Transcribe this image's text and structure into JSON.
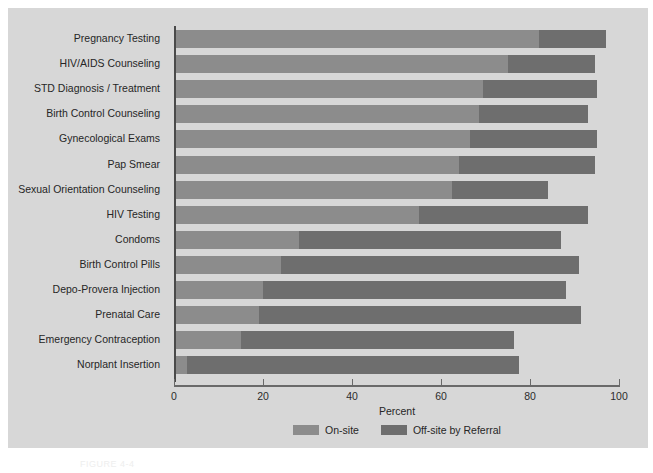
{
  "chart_data": {
    "type": "bar",
    "orientation": "horizontal",
    "stacked": true,
    "title": "",
    "xlabel": "Percent",
    "ylabel": "",
    "xlim": [
      0,
      100
    ],
    "xticks": [
      0,
      20,
      40,
      60,
      80,
      100
    ],
    "grid": false,
    "legend_position": "bottom-center",
    "categories": [
      "Pregnancy Testing",
      "HIV/AIDS Counseling",
      "STD Diagnosis / Treatment",
      "Birth Control Counseling",
      "Gynecological Exams",
      "Pap Smear",
      "Sexual Orientation Counseling",
      "HIV Testing",
      "Condoms",
      "Birth Control Pills",
      "Depo-Provera Injection",
      "Prenatal Care",
      "Emergency Contraception",
      "Norplant Insertion"
    ],
    "series": [
      {
        "name": "On-site",
        "color": "#8c8c8c",
        "values": [
          82,
          75,
          69.5,
          68.5,
          66.5,
          64,
          62.5,
          55,
          28,
          24,
          20,
          19,
          15,
          3
        ]
      },
      {
        "name": "Off-site by Referral",
        "color": "#6e6e6e",
        "values": [
          15,
          19.5,
          25.5,
          24.5,
          28.5,
          30.5,
          21.5,
          38,
          59,
          67,
          68,
          72.5,
          61.5,
          74.5
        ]
      }
    ],
    "totals": [
      97,
      94.5,
      95,
      93,
      95,
      94.5,
      84,
      93,
      87,
      91,
      88,
      91.5,
      76.5,
      77.5
    ]
  },
  "axis": {
    "x_title": "Percent",
    "tick_labels": [
      "0",
      "20",
      "40",
      "60",
      "80",
      "100"
    ]
  },
  "legend": {
    "entries": [
      {
        "label": "On-site",
        "color": "#8c8c8c"
      },
      {
        "label": "Off-site by Referral",
        "color": "#6e6e6e"
      }
    ]
  },
  "caption": "FIGURE 4-4",
  "colors": {
    "panel_background": "#d7d7d7",
    "page_background": "#ffffff",
    "axis": "#4a4a4a",
    "text": "#262626",
    "onsite": "#8c8c8c",
    "offsite": "#6e6e6e"
  }
}
